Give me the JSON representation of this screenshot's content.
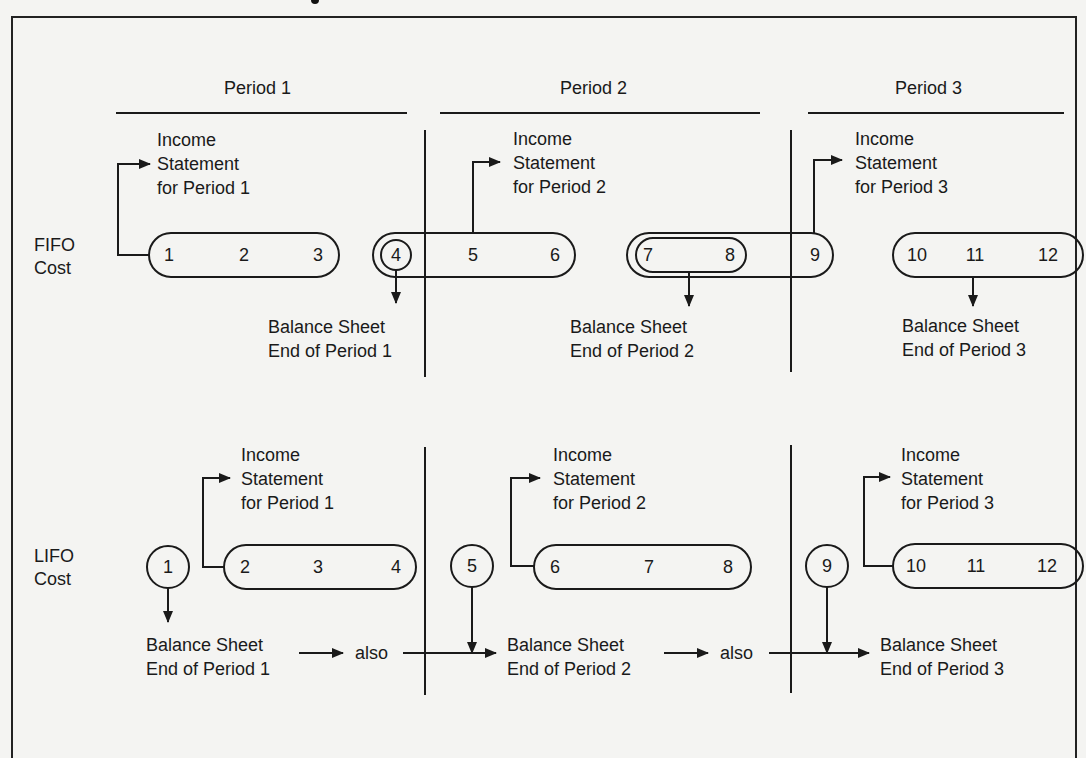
{
  "diagram": {
    "periods": [
      "Period 1",
      "Period 2",
      "Period 3"
    ],
    "rows": [
      {
        "method": [
          "FIFO",
          "Cost"
        ],
        "units": [
          "1",
          "2",
          "3",
          "4",
          "5",
          "6",
          "7",
          "8",
          "9",
          "10",
          "11",
          "12"
        ],
        "income_statements": [
          [
            "Income",
            "Statement",
            "for Period 1"
          ],
          [
            "Income",
            "Statement",
            "for Period 2"
          ],
          [
            "Income",
            "Statement",
            "for Period 3"
          ]
        ],
        "balance_sheets": [
          [
            "Balance Sheet",
            "End of Period 1"
          ],
          [
            "Balance Sheet",
            "End of Period 2"
          ],
          [
            "Balance Sheet",
            "End of Period 3"
          ]
        ]
      },
      {
        "method": [
          "LIFO",
          "Cost"
        ],
        "units": [
          "1",
          "2",
          "3",
          "4",
          "5",
          "6",
          "7",
          "8",
          "9",
          "10",
          "11",
          "12"
        ],
        "income_statements": [
          [
            "Income",
            "Statement",
            "for Period 1"
          ],
          [
            "Income",
            "Statement",
            "for Period 2"
          ],
          [
            "Income",
            "Statement",
            "for Period 3"
          ]
        ],
        "balance_sheets": [
          [
            "Balance Sheet",
            "End of Period 1"
          ],
          [
            "Balance Sheet",
            "End of Period 2"
          ],
          [
            "Balance Sheet",
            "End of Period 3"
          ]
        ],
        "connectors": [
          "also",
          "also"
        ]
      }
    ],
    "colors": {
      "ink": "#1a1a1a",
      "paper": "#f4f4f2"
    }
  }
}
